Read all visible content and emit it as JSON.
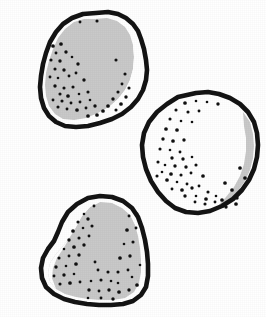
{
  "figure": {
    "background_color": "#ffffff",
    "canvas": {
      "width": 266,
      "height": 317
    },
    "style": {
      "outline_color": "#141414",
      "outline_width": 4.6,
      "shading_gray": "#c9c9c9",
      "highlight_white": "#ffffff",
      "stipple_color": "#111111",
      "stipple_radius": 1.6
    }
  },
  "chart_data": {
    "type": "scatter",
    "xlabel": "",
    "ylabel": "",
    "xlim": [
      0,
      266
    ],
    "ylim": [
      0,
      317
    ],
    "grid": false,
    "legend": "none",
    "shapes": [
      {
        "name": "specimen-top-left",
        "label": "Specimen 1",
        "bbox": [
          38,
          11,
          148,
          131
        ],
        "shading": "gray-body-with-white-crescent-right",
        "outline": "M 96 13 L 108 12 L 118 14 L 126 18 L 133 24 L 138 31 L 141 39 L 144 49 L 146 60 L 147 70 L 146 80 L 143 90 L 138 99 L 131 107 L 122 114 L 112 119 L 100 123 L 88 126 L 76 127 L 65 126 L 56 122 L 49 116 L 44 108 L 41 98 L 40 87 L 41 76 L 43 64 L 46 53 L 50 42 L 56 32 L 63 24 L 72 18 L 83 14 Z",
        "gray_region": "M 95 19 L 107 18 L 117 21 L 125 27 L 130 35 L 133 45 L 134 57 L 133 69 L 130 80 L 125 90 L 118 99 L 109 107 L 98 113 L 86 118 L 74 120 L 63 119 L 55 114 L 49 106 L 46 96 L 45 85 L 46 73 L 49 61 L 53 49 L 58 38 L 65 29 L 74 22 L 84 19 Z",
        "white_crescent": "M 133 45 L 138 55 L 140 66 L 139 77 L 136 87 L 130 96 L 122 105 L 112 112 L 100 118 L 88 122 L 98 113 L 109 107 L 118 99 L 125 90 L 130 80 L 133 69 L 134 57 Z",
        "dots": [
          [
            80,
            22
          ],
          [
            97,
            21
          ],
          [
            53,
            46
          ],
          [
            61,
            44
          ],
          [
            56,
            53
          ],
          [
            66,
            52
          ],
          [
            51,
            60
          ],
          [
            60,
            61
          ],
          [
            72,
            57
          ],
          [
            78,
            64
          ],
          [
            55,
            69
          ],
          [
            64,
            70
          ],
          [
            50,
            77
          ],
          [
            58,
            78
          ],
          [
            69,
            76
          ],
          [
            76,
            73
          ],
          [
            84,
            80
          ],
          [
            55,
            86
          ],
          [
            64,
            88
          ],
          [
            73,
            87
          ],
          [
            60,
            94
          ],
          [
            68,
            96
          ],
          [
            79,
            94
          ],
          [
            88,
            92
          ],
          [
            53,
            100
          ],
          [
            62,
            101
          ],
          [
            71,
            103
          ],
          [
            80,
            102
          ],
          [
            90,
            100
          ],
          [
            58,
            107
          ],
          [
            67,
            109
          ],
          [
            77,
            110
          ],
          [
            86,
            108
          ],
          [
            95,
            106
          ],
          [
            116,
            60
          ],
          [
            125,
            74
          ],
          [
            122,
            84
          ],
          [
            129,
            88
          ],
          [
            118,
            92
          ],
          [
            126,
            97
          ],
          [
            113,
            99
          ],
          [
            121,
            104
          ],
          [
            108,
            106
          ],
          [
            116,
            110
          ],
          [
            103,
            111
          ],
          [
            97,
            115
          ],
          [
            88,
            116
          ]
        ]
      },
      {
        "name": "specimen-right-middle",
        "label": "Specimen 2",
        "bbox": [
          141,
          90,
          259,
          216
        ],
        "shading": "white-body-with-gray-crescent-right",
        "outline": "M 196 93 L 208 92 L 219 94 L 230 98 L 240 104 L 248 112 L 254 122 L 257 133 L 258 145 L 257 157 L 254 169 L 249 180 L 242 190 L 233 199 L 222 206 L 210 211 L 198 213 L 186 212 L 175 208 L 166 201 L 158 192 L 151 181 L 146 169 L 143 157 L 142 145 L 144 133 L 149 122 L 157 112 L 167 104 L 178 97 Z",
        "gray_region": "M 243 112 L 250 122 L 253 134 L 254 146 L 253 158 L 250 170 L 245 181 L 238 191 L 229 200 L 218 206 L 226 197 L 234 187 L 240 176 L 244 164 L 246 151 L 246 138 L 244 126 Z",
        "dots": [
          [
            185,
            103
          ],
          [
            196,
            101
          ],
          [
            207,
            102
          ],
          [
            218,
            104
          ],
          [
            176,
            110
          ],
          [
            188,
            112
          ],
          [
            199,
            111
          ],
          [
            170,
            119
          ],
          [
            181,
            121
          ],
          [
            192,
            122
          ],
          [
            166,
            129
          ],
          [
            177,
            130
          ],
          [
            163,
            139
          ],
          [
            173,
            141
          ],
          [
            184,
            140
          ],
          [
            160,
            149
          ],
          [
            170,
            150
          ],
          [
            180,
            152
          ],
          [
            172,
            158
          ],
          [
            183,
            159
          ],
          [
            192,
            157
          ],
          [
            158,
            162
          ],
          [
            165,
            165
          ],
          [
            175,
            166
          ],
          [
            186,
            167
          ],
          [
            162,
            172
          ],
          [
            171,
            174
          ],
          [
            181,
            175
          ],
          [
            191,
            173
          ],
          [
            157,
            176
          ],
          [
            167,
            180
          ],
          [
            177,
            182
          ],
          [
            187,
            184
          ],
          [
            172,
            189
          ],
          [
            182,
            190
          ],
          [
            192,
            188
          ],
          [
            196,
            165
          ],
          [
            203,
            176
          ],
          [
            199,
            186
          ],
          [
            208,
            192
          ],
          [
            196,
            196
          ],
          [
            206,
            199
          ],
          [
            216,
            196
          ],
          [
            225,
            183
          ],
          [
            232,
            190
          ],
          [
            222,
            200
          ],
          [
            240,
            168
          ],
          [
            245,
            178
          ],
          [
            237,
            198
          ],
          [
            185,
            196
          ],
          [
            195,
            202
          ],
          [
            205,
            204
          ],
          [
            215,
            202
          ],
          [
            226,
            207
          ],
          [
            236,
            204
          ]
        ]
      },
      {
        "name": "specimen-bottom-left",
        "label": "Specimen 3",
        "bbox": [
          40,
          194,
          150,
          306
        ],
        "shading": "gray-body-with-white-crescent-upper-left",
        "outline": "M 100 196 L 112 197 L 123 201 L 132 208 L 138 217 L 142 228 L 145 240 L 147 252 L 148 264 L 148 276 L 146 287 L 141 295 L 133 301 L 123 304 L 111 305 L 99 305 L 87 304 L 75 302 L 64 299 L 54 294 L 46 287 L 42 278 L 41 268 L 43 258 L 48 249 L 54 241 L 58 232 L 62 222 L 68 212 L 77 204 L 88 198 Z",
        "gray_region": "M 100 202 L 112 203 L 122 208 L 130 215 L 135 225 L 138 236 L 140 248 L 141 260 L 141 272 L 139 283 L 134 292 L 125 298 L 113 300 L 100 300 L 88 299 L 76 297 L 65 294 L 56 289 L 50 282 L 48 273 L 50 263 L 56 254 L 63 246 L 70 237 L 76 227 L 82 216 L 90 207 Z",
        "white_crescent": "M 100 202 L 90 207 L 82 216 L 76 227 L 70 237 L 63 246 L 56 254 L 50 263 L 48 273 L 50 282 L 56 289 L 52 278 L 53 268 L 57 258 L 63 249 L 69 239 L 74 229 L 79 218 L 85 209 L 93 201 Z",
        "dots": [
          [
            94,
            206
          ],
          [
            84,
            214
          ],
          [
            78,
            222
          ],
          [
            88,
            219
          ],
          [
            73,
            231
          ],
          [
            83,
            228
          ],
          [
            92,
            226
          ],
          [
            69,
            240
          ],
          [
            79,
            238
          ],
          [
            89,
            236
          ],
          [
            64,
            249
          ],
          [
            74,
            247
          ],
          [
            84,
            245
          ],
          [
            59,
            258
          ],
          [
            69,
            256
          ],
          [
            79,
            255
          ],
          [
            56,
            267
          ],
          [
            66,
            266
          ],
          [
            76,
            264
          ],
          [
            54,
            276
          ],
          [
            64,
            275
          ],
          [
            74,
            274
          ],
          [
            60,
            284
          ],
          [
            70,
            283
          ],
          [
            80,
            282
          ],
          [
            89,
            290
          ],
          [
            99,
            291
          ],
          [
            109,
            290
          ],
          [
            91,
            281
          ],
          [
            101,
            280
          ],
          [
            111,
            281
          ],
          [
            118,
            272
          ],
          [
            128,
            270
          ],
          [
            120,
            258
          ],
          [
            130,
            256
          ],
          [
            124,
            244
          ],
          [
            133,
            242
          ],
          [
            127,
            230
          ],
          [
            136,
            228
          ],
          [
            129,
            216
          ],
          [
            137,
            214
          ],
          [
            119,
            292
          ],
          [
            129,
            290
          ],
          [
            137,
            285
          ],
          [
            113,
            299
          ],
          [
            101,
            298
          ],
          [
            88,
            298
          ],
          [
            118,
            283
          ],
          [
            132,
            277
          ],
          [
            140,
            265
          ],
          [
            108,
            272
          ],
          [
            98,
            270
          ],
          [
            95,
            262
          ]
        ]
      }
    ]
  }
}
